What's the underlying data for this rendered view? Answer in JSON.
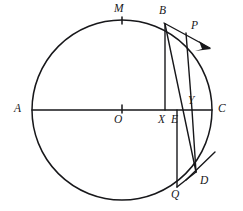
{
  "figure": {
    "stroke_color": "#17171a",
    "background_color": "#ffffff",
    "width": 243,
    "height": 211
  },
  "circle": {
    "name": "main-circle",
    "center_label": "O",
    "center_x": 122,
    "center_y": 110,
    "radius": 90
  },
  "points": [
    {
      "id": "A",
      "label": "A",
      "x": 32,
      "y": 110,
      "label_x": 14,
      "label_y": 103,
      "on_circle": true,
      "description": "left end of horizontal diameter"
    },
    {
      "id": "C",
      "label": "C",
      "x": 212,
      "y": 110,
      "label_x": 218,
      "label_y": 103,
      "on_circle": true,
      "description": "right end of horizontal diameter"
    },
    {
      "id": "M",
      "label": "M",
      "x": 122,
      "y": 20,
      "label_x": 114,
      "label_y": 4,
      "on_circle": true,
      "description": "top of circle, tick marked"
    },
    {
      "id": "O",
      "label": "O",
      "x": 122,
      "y": 110,
      "label_x": 114,
      "label_y": 114,
      "on_circle": false,
      "description": "centre of circle, tick marked"
    },
    {
      "id": "B",
      "label": "B",
      "x": 165,
      "y": 24,
      "label_x": 159,
      "label_y": 6,
      "on_circle": true,
      "description": "point on upper-right arc"
    },
    {
      "id": "P",
      "label": "P",
      "x": 186,
      "y": 33,
      "label_x": 191,
      "label_y": 20,
      "on_circle": false,
      "description": "point on tangent drawn at B"
    },
    {
      "id": "X",
      "label": "X",
      "x": 165,
      "y": 110,
      "label_x": 158,
      "label_y": 114,
      "on_circle": false,
      "description": "foot of perpendicular from B to diameter"
    },
    {
      "id": "E",
      "label": "E",
      "x": 177,
      "y": 110,
      "label_x": 172,
      "label_y": 114,
      "on_circle": false,
      "description": "point on diameter between X and Y"
    },
    {
      "id": "Y",
      "label": "Y",
      "x": 192,
      "y": 110,
      "label_x": 188,
      "label_y": 96,
      "on_circle": false,
      "description": "foot of perpendicular from P to diameter"
    },
    {
      "id": "D",
      "label": "D",
      "x": 196,
      "y": 172,
      "label_x": 200,
      "label_y": 176,
      "on_circle": true,
      "description": "point on lower-right arc, tangent drawn here"
    },
    {
      "id": "Q",
      "label": "Q",
      "x": 177,
      "y": 187,
      "label_x": 172,
      "label_y": 190,
      "on_circle": true,
      "description": "point on lower arc directly below E"
    }
  ],
  "segments": [
    {
      "name": "diameter-AC",
      "from": "A",
      "to": "C",
      "kind": "diameter"
    },
    {
      "name": "segment-BX",
      "from": "B",
      "to": "X",
      "kind": "perpendicular"
    },
    {
      "name": "segment-BD",
      "from": "B",
      "to": "D",
      "kind": "chord"
    },
    {
      "name": "segment-PY",
      "from": "P",
      "to": "Y",
      "kind": "perpendicular"
    },
    {
      "name": "segment-YD",
      "from": "Y",
      "to": "D",
      "kind": "segment"
    },
    {
      "name": "segment-EQ",
      "from": "E",
      "to": "Q",
      "kind": "perpendicular"
    },
    {
      "name": "segment-QD",
      "from": "Q",
      "to": "D",
      "kind": "segment"
    }
  ],
  "tangents": [
    {
      "name": "tangent-at-B",
      "at_point": "B",
      "through": "P",
      "arrow": true,
      "direction": "down-right"
    },
    {
      "name": "tangent-at-D",
      "at_point": "D",
      "arrow": false,
      "direction": "up-right"
    }
  ],
  "ticks": [
    {
      "name": "tick-M",
      "at_point": "M",
      "orientation": "radial"
    },
    {
      "name": "tick-O",
      "at_point": "O",
      "orientation": "vertical"
    }
  ]
}
